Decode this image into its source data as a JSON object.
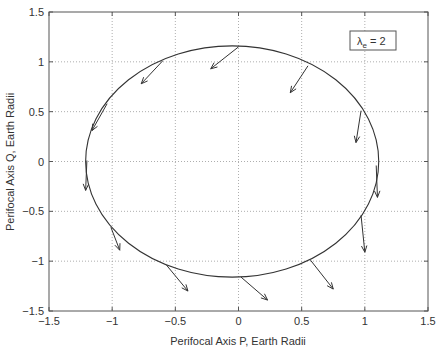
{
  "chart_data": {
    "type": "line",
    "title": "",
    "xlabel": "Perifocal Axis P, Earth Radii",
    "ylabel": "Perifocal Axis Q, Earth Radii",
    "xlim": [
      -1.5,
      1.5
    ],
    "ylim": [
      -1.5,
      1.5
    ],
    "grid": true,
    "xticks": [
      "-1.5",
      "-1",
      "-0.5",
      "0",
      "0.5",
      "1",
      "1.5"
    ],
    "yticks": [
      "1.5",
      "1",
      "0.5",
      "0",
      "-0.5",
      "-1",
      "-1.5"
    ],
    "legend": {
      "text_main": "λ",
      "text_sub": "e",
      "text_rest": " = 2",
      "position": "upper right"
    },
    "ellipse": {
      "center": [
        -0.05,
        0.0
      ],
      "semi_axis_p": 1.16,
      "semi_axis_q": 1.16
    },
    "arrows": [
      {
        "from": [
          0.0,
          1.15
        ],
        "to": [
          -0.22,
          0.93
        ]
      },
      {
        "from": [
          -0.6,
          1.01
        ],
        "to": [
          -0.77,
          0.78
        ]
      },
      {
        "from": [
          0.55,
          0.96
        ],
        "to": [
          0.41,
          0.69
        ]
      },
      {
        "from": [
          -1.04,
          0.58
        ],
        "to": [
          -1.16,
          0.31
        ]
      },
      {
        "from": [
          -1.2,
          0.01
        ],
        "to": [
          -1.21,
          -0.29
        ]
      },
      {
        "from": [
          0.97,
          0.51
        ],
        "to": [
          0.93,
          0.19
        ]
      },
      {
        "from": [
          1.09,
          -0.04
        ],
        "to": [
          1.1,
          -0.36
        ]
      },
      {
        "from": [
          0.97,
          -0.54
        ],
        "to": [
          1.0,
          -0.91
        ]
      },
      {
        "from": [
          -1.01,
          -0.66
        ],
        "to": [
          -0.94,
          -0.89
        ]
      },
      {
        "from": [
          -0.57,
          -1.04
        ],
        "to": [
          -0.4,
          -1.3
        ]
      },
      {
        "from": [
          0.02,
          -1.16
        ],
        "to": [
          0.23,
          -1.39
        ]
      },
      {
        "from": [
          0.57,
          -0.99
        ],
        "to": [
          0.75,
          -1.28
        ]
      }
    ]
  }
}
